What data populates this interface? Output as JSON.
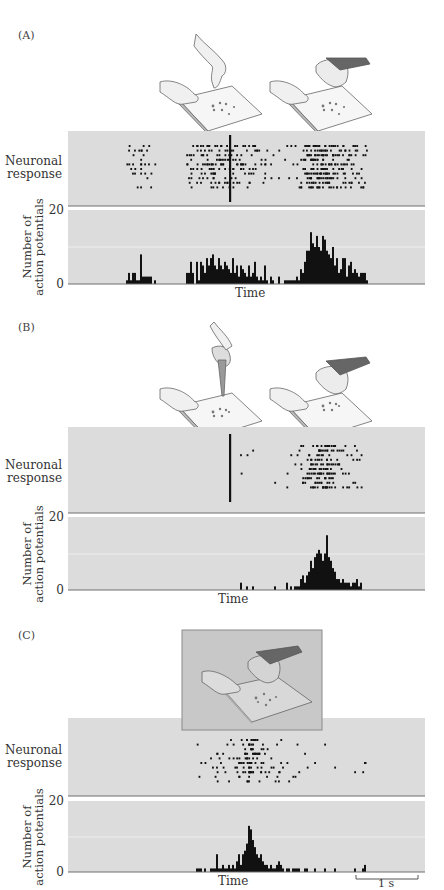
{
  "figure": {
    "panels": [
      {
        "id": "A",
        "label": "(A)",
        "raster_ylabel_line1": "Neuronal",
        "raster_ylabel_line2": "response",
        "hist_ylabel_line1": "Number of",
        "hist_ylabel_line2": "action potentials",
        "hist_ytick_max": "20",
        "hist_ytick_min": "0",
        "xlabel": "Time",
        "illustration": "two hands: one grasping food pellet from board, one (hairy monkey hand) grasping from board",
        "has_event_marker": true
      },
      {
        "id": "B",
        "label": "(B)",
        "raster_ylabel_line1": "Neuronal",
        "raster_ylabel_line2": "response",
        "hist_ylabel_line1": "Number of",
        "hist_ylabel_line2": "action potentials",
        "hist_ytick_max": "20",
        "hist_ytick_min": "0",
        "xlabel": "Time",
        "illustration": "hand grasping pellet with pliers tool; monkey hand grasping pellet",
        "has_event_marker": true
      },
      {
        "id": "C",
        "label": "(C)",
        "raster_ylabel_line1": "Neuronal",
        "raster_ylabel_line2": "response",
        "hist_ylabel_line1": "Number of",
        "hist_ylabel_line2": "action potentials",
        "hist_ytick_max": "20",
        "hist_ytick_min": "0",
        "xlabel": "Time",
        "illustration": "monkey hand grasping pellet, shown in darkened box",
        "has_event_marker": false
      }
    ],
    "scale_bar_label": "1 s"
  },
  "colors": {
    "panel_bg": "#dcdcdc",
    "axis": "#6e6e6e",
    "gridline": "#f2f2f2",
    "spikes": "#111111",
    "illustration_box": "#c8c8c8"
  },
  "chart_data": [
    {
      "type": "bar",
      "title": "(A) Peri-stimulus time histogram",
      "xlabel": "Time",
      "ylabel": "Number of action potentials",
      "ylim": [
        0,
        20
      ],
      "grid": "single horizontal line at 10",
      "bin_start_px": 126,
      "bin_width_px": 2,
      "values": [
        1,
        3,
        1,
        3,
        3,
        1,
        1,
        8,
        2,
        2,
        2,
        2,
        2,
        0,
        1,
        0,
        0,
        0,
        0,
        0,
        0,
        0,
        0,
        0,
        0,
        0,
        0,
        0,
        0,
        0,
        3,
        3,
        6,
        3,
        0,
        6,
        1,
        6,
        5,
        3,
        7,
        5,
        7,
        8,
        5,
        4,
        7,
        5,
        4,
        6,
        5,
        4,
        3,
        7,
        3,
        5,
        2,
        5,
        4,
        3,
        2,
        5,
        2,
        3,
        6,
        2,
        1,
        2,
        1,
        5,
        1,
        0,
        2,
        1,
        0,
        0,
        2,
        0,
        0,
        1,
        1,
        1,
        1,
        1,
        1,
        2,
        1,
        4,
        3,
        6,
        9,
        9,
        14,
        11,
        10,
        13,
        10,
        9,
        13,
        12,
        9,
        8,
        7,
        10,
        5,
        7,
        3,
        4,
        7,
        7,
        2,
        5,
        6,
        3,
        4,
        3,
        2,
        3,
        3,
        3,
        1
      ]
    },
    {
      "type": "bar",
      "title": "(B) Peri-stimulus time histogram",
      "xlabel": "Time",
      "ylabel": "Number of action potentials",
      "ylim": [
        0,
        20
      ],
      "grid": "single horizontal line at 10",
      "bin_start_px": 240,
      "bin_width_px": 2,
      "values": [
        2,
        0,
        0,
        1,
        0,
        0,
        1,
        0,
        0,
        0,
        0,
        0,
        0,
        0,
        0,
        0,
        0,
        1,
        0,
        0,
        0,
        0,
        0,
        2,
        0,
        1,
        0,
        1,
        1,
        1,
        3,
        4,
        2,
        4,
        5,
        8,
        6,
        9,
        10,
        11,
        10,
        8,
        10,
        15,
        9,
        8,
        6,
        5,
        3,
        3,
        2,
        3,
        2,
        2,
        2,
        1,
        2,
        2,
        3,
        1,
        2
      ]
    },
    {
      "type": "bar",
      "title": "(C) Peri-stimulus time histogram",
      "xlabel": "Time",
      "ylabel": "Number of action potentials",
      "ylim": [
        0,
        20
      ],
      "grid": "single horizontal line at 10",
      "bin_start_px": 196,
      "bin_width_px": 2,
      "values": [
        1,
        1,
        1,
        0,
        1,
        0,
        0,
        1,
        1,
        1,
        5,
        1,
        1,
        2,
        1,
        1,
        2,
        1,
        2,
        1,
        3,
        5,
        2,
        5,
        6,
        8,
        13,
        12,
        9,
        7,
        5,
        4,
        5,
        3,
        2,
        2,
        1,
        2,
        1,
        1,
        2,
        3,
        2,
        1,
        0,
        1,
        1,
        0,
        1,
        1,
        1,
        1,
        0,
        0,
        1,
        1,
        0,
        0,
        0,
        1,
        0,
        0,
        0,
        0,
        1,
        0,
        0,
        0,
        0,
        1,
        0,
        0,
        0,
        0,
        0,
        0,
        0,
        0,
        0,
        1,
        0,
        0,
        0,
        1,
        2,
        0
      ],
      "scale_bar": "1 s"
    }
  ]
}
